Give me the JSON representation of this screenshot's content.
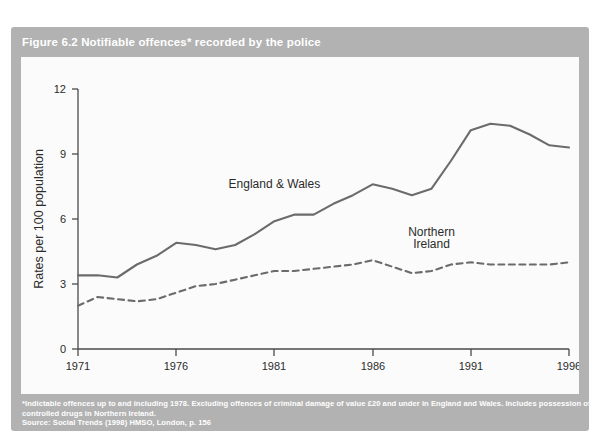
{
  "figure": {
    "title": "Figure 6.2 Notifiable offences* recorded by the police",
    "card_color": "#b2b2b2",
    "panel_color": "#fbfbfb",
    "line_color": "#6b6b6b",
    "text_color": "#2b2b2b"
  },
  "footnote": {
    "line1": "*Indictable offences up to and including 1978. Excluding offences of criminal damage of value £20 and under in England and Wales. Includes possession of",
    "line2": "controlled drugs in Northern Ireland.",
    "source": "Source: Social Trends (1998) HMSO, London, p. 156"
  },
  "chart_data": {
    "type": "line",
    "title": "Figure 6.2 Notifiable offences* recorded by the police",
    "xlabel": "",
    "ylabel": "Rates per 100 population",
    "xlim": [
      1971,
      1996
    ],
    "ylim": [
      0,
      12
    ],
    "yticks": [
      0,
      3,
      6,
      9,
      12
    ],
    "xticks": [
      1971,
      1976,
      1981,
      1986,
      1991,
      1996
    ],
    "ytick_labels": [
      "0",
      "3",
      "6",
      "9",
      "12"
    ],
    "xtick_labels": [
      "1971",
      "1976",
      "1981",
      "1986",
      "1991",
      "1996"
    ],
    "grid": false,
    "legend": "inline-annotations",
    "x": [
      1971,
      1972,
      1973,
      1974,
      1975,
      1976,
      1977,
      1978,
      1979,
      1980,
      1981,
      1982,
      1983,
      1984,
      1985,
      1986,
      1987,
      1988,
      1989,
      1990,
      1991,
      1992,
      1993,
      1994,
      1995,
      1996
    ],
    "series": [
      {
        "name": "England & Wales",
        "style": "solid",
        "label": "England & Wales",
        "values": [
          3.4,
          3.4,
          3.3,
          3.9,
          4.3,
          4.9,
          4.8,
          4.6,
          4.8,
          5.3,
          5.9,
          6.2,
          6.2,
          6.7,
          7.1,
          7.6,
          7.4,
          7.1,
          7.4,
          8.7,
          10.1,
          10.4,
          10.3,
          9.9,
          9.4,
          9.3
        ]
      },
      {
        "name": "Northern Ireland",
        "style": "dashed",
        "label": "Northern Ireland",
        "values": [
          2.0,
          2.4,
          2.3,
          2.2,
          2.3,
          2.6,
          2.9,
          3.0,
          3.2,
          3.4,
          3.6,
          3.6,
          3.7,
          3.8,
          3.9,
          4.1,
          3.8,
          3.5,
          3.6,
          3.9,
          4.0,
          3.9,
          3.9,
          3.9,
          3.9,
          4.0
        ]
      }
    ],
    "annotations": [
      {
        "text": "England & Wales",
        "x": 1981.0,
        "y": 7.45
      },
      {
        "text": "Northern",
        "x": 1989.0,
        "y": 5.2
      },
      {
        "text": "Ireland",
        "x": 1989.0,
        "y": 4.65
      }
    ]
  }
}
